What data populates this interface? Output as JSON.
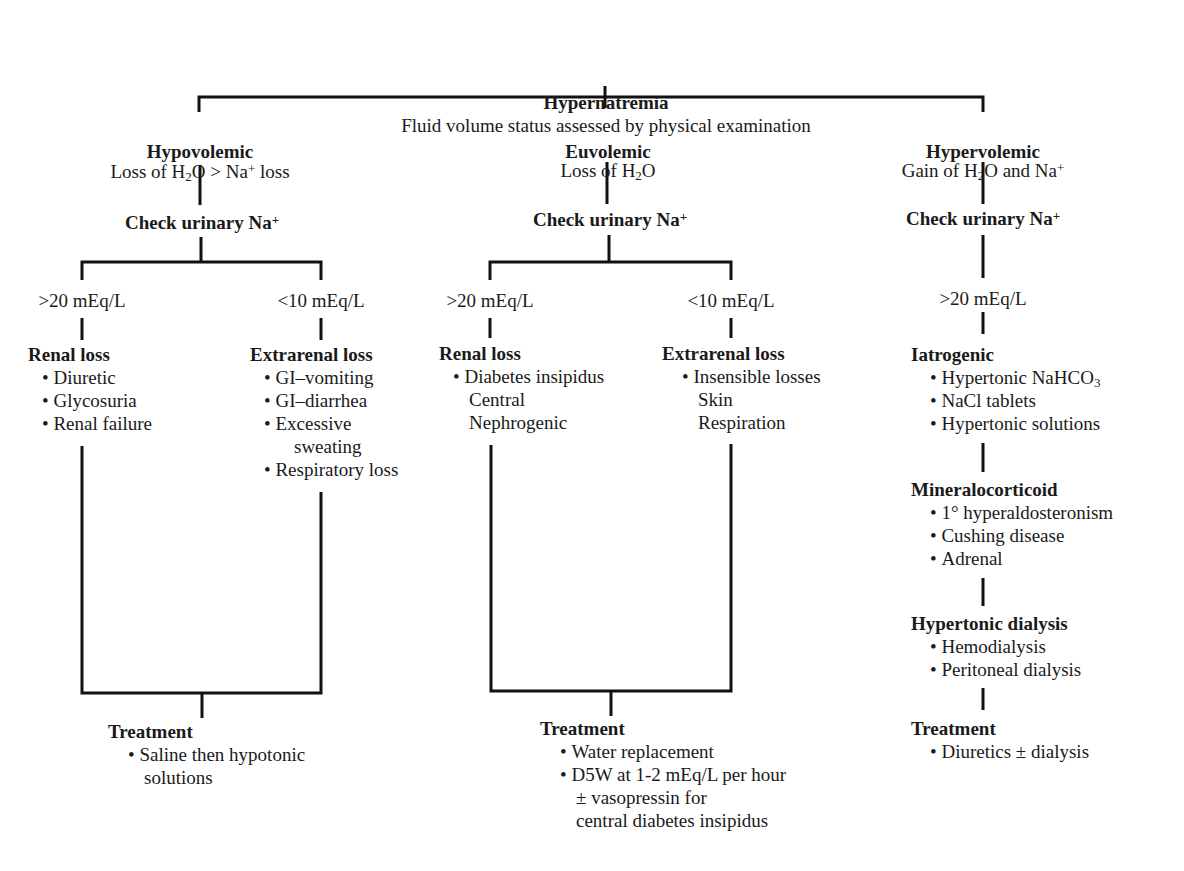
{
  "root": {
    "title": "Hypernatremia",
    "subtitle": "Fluid volume status assessed by physical examination"
  },
  "columns": [
    {
      "id": "hypovolemic",
      "title": "Hypovolemic",
      "description": {
        "pre": "Loss of H",
        "sub": "2",
        "mid": "O > Na",
        "sup": "+",
        "post": " loss"
      },
      "check": {
        "text": "Check urinary Na",
        "sup": "+"
      },
      "branches": [
        {
          "threshold": ">20 mEq/L",
          "heading": "Renal loss",
          "items": [
            "Diuretic",
            "Glycosuria",
            "Renal failure"
          ]
        },
        {
          "threshold": "<10 mEq/L",
          "heading": "Extrarenal loss",
          "items": [
            "GI–vomiting",
            "GI–diarrhea",
            "Excessive",
            "sweating",
            "Respiratory loss"
          ]
        }
      ],
      "treatment": {
        "heading": "Treatment",
        "items": [
          "Saline then hypotonic",
          "solutions"
        ]
      }
    },
    {
      "id": "euvolemic",
      "title": "Euvolemic",
      "description": {
        "pre": "Loss of H",
        "sub": "2",
        "mid": "O",
        "sup": "",
        "post": ""
      },
      "check": {
        "text": "Check urinary Na",
        "sup": "+"
      },
      "branches": [
        {
          "threshold": ">20 mEq/L",
          "heading": "Renal loss",
          "items": [
            "Diabetes insipidus",
            "Central",
            "Nephrogenic"
          ]
        },
        {
          "threshold": "<10 mEq/L",
          "heading": "Extrarenal loss",
          "items": [
            "Insensible losses",
            "Skin",
            "Respiration"
          ]
        }
      ],
      "treatment": {
        "heading": "Treatment",
        "items": [
          "Water replacement",
          "D5W at 1-2 mEq/L per hour",
          "± vasopressin for",
          "central diabetes insipidus"
        ]
      }
    },
    {
      "id": "hypervolemic",
      "title": "Hypervolemic",
      "description": {
        "pre": "Gain of H",
        "sub": "2",
        "mid": "O and Na",
        "sup": "+",
        "post": ""
      },
      "check": {
        "text": "Check urinary Na",
        "sup": "+"
      },
      "threshold": ">20 mEq/L",
      "groups": [
        {
          "heading": "Iatrogenic",
          "items": [
            {
              "pre": "Hypertonic NaHCO",
              "sub": "3"
            },
            {
              "pre": "NaCl tablets",
              "sub": ""
            },
            {
              "pre": "Hypertonic solutions",
              "sub": ""
            }
          ]
        },
        {
          "heading": "Mineralocorticoid",
          "items": [
            "1° hyperaldosteronism",
            "Cushing disease",
            "Adrenal"
          ]
        },
        {
          "heading": "Hypertonic dialysis",
          "items": [
            "Hemodialysis",
            "Peritoneal dialysis"
          ]
        }
      ],
      "treatment": {
        "heading": "Treatment",
        "items": [
          "Diuretics ± dialysis"
        ]
      }
    }
  ]
}
